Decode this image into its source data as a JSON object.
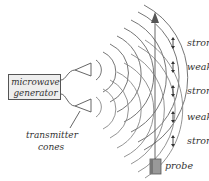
{
  "diagram": {
    "generator_label_line1": "microwave",
    "generator_label_line2": "generator",
    "cones_label_line1": "transmitter",
    "cones_label_line2": "cones",
    "probe_label": "probe",
    "states": [
      {
        "label": "strong",
        "y": 42
      },
      {
        "label": "weak",
        "y": 66
      },
      {
        "label": "strong",
        "y": 90
      },
      {
        "label": "weak",
        "y": 116
      },
      {
        "label": "strong",
        "y": 140
      }
    ]
  },
  "colors": {
    "stroke": "#555555",
    "text": "#333333",
    "box_fill": "#eeeeee",
    "probe_fill": "#999999"
  }
}
